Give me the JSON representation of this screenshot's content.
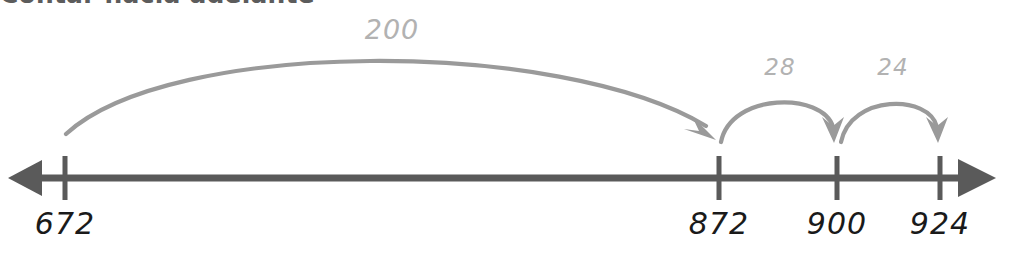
{
  "title": "Contar hacia adelante",
  "colors": {
    "title": "#5c5c5c",
    "axis": "#5a5a5a",
    "tick_label": "#1a1a1a",
    "arc": "#9a9a9a",
    "jump_label": "#b2b2b2",
    "background": "#ffffff"
  },
  "number_line": {
    "direction": "bidirectional",
    "left_arrow": "arrow-left",
    "right_arrow": "arrow-right",
    "ticks": [
      {
        "label": "672",
        "x": 65
      },
      {
        "label": "872",
        "x": 719
      },
      {
        "label": "900",
        "x": 837
      },
      {
        "label": "924",
        "x": 940
      }
    ]
  },
  "jumps": [
    {
      "label": "200",
      "from": "672",
      "to": "872",
      "from_x": 66,
      "to_x": 716,
      "label_x": 392,
      "label_y": 14,
      "size": "big"
    },
    {
      "label": "28",
      "from": "872",
      "to": "900",
      "from_x": 721,
      "to_x": 834,
      "label_x": 780,
      "label_y": 54,
      "size": "small"
    },
    {
      "label": "24",
      "from": "900",
      "to": "924",
      "from_x": 841,
      "to_x": 937,
      "label_x": 893,
      "label_y": 54,
      "size": "small"
    }
  ]
}
